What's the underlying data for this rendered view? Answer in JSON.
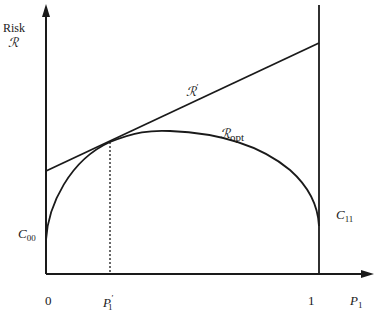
{
  "diagram": {
    "y_axis": {
      "label_line1": "Risk",
      "label_line2": "ℛ"
    },
    "x_axis": {
      "label_main": "P",
      "label_sub": "1"
    },
    "ticks": {
      "zero": "0",
      "p1prime_main": "P",
      "p1prime_sup": "′",
      "p1prime_sub": "1",
      "one": "1"
    },
    "curves": {
      "r_prime": {
        "main": "ℛ",
        "sup": "′"
      },
      "r_opt": {
        "main": "ℛ",
        "sub": "opt"
      }
    },
    "endpoints": {
      "c00_main": "C",
      "c00_sub": "00",
      "c11_main": "C",
      "c11_sub": "11"
    },
    "colors": {
      "line": "#1a1a1a",
      "background": "#ffffff"
    }
  }
}
